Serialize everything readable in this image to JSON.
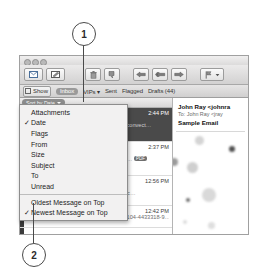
{
  "callouts": [
    {
      "id": "1",
      "label": "1"
    },
    {
      "id": "2",
      "label": "2"
    }
  ],
  "window": {
    "traffic_lights": [
      "close-button",
      "minimize-button",
      "zoom-button"
    ],
    "toolbar": {
      "get_mail_icon": "envelope-icon",
      "compose_icon": "compose-pencil-icon",
      "delete_icon": "trash-icon",
      "junk_icon": "junk-thumb-down-icon",
      "reply_icon": "reply-arrow-icon",
      "reply_all_icon": "reply-all-arrow-icon",
      "forward_icon": "forward-arrow-icon",
      "flag_icon": "flag-icon",
      "flag_caret_icon": "chevron-down-icon"
    },
    "mailbox_bar": {
      "show_label": "Show",
      "show_icon": "sidebar-icon",
      "items": [
        {
          "label": "Inbox",
          "selected": true
        },
        {
          "label": "VIPs ▾",
          "selected": false
        },
        {
          "label": "Sent",
          "selected": false
        },
        {
          "label": "Flagged",
          "selected": false
        },
        {
          "label": "Drafts (44)",
          "selected": false
        }
      ]
    },
    "message_list": {
      "sort_button": {
        "label": "Sort by Date",
        "caret_icon": "chevron-down-icon"
      },
      "messages": [
        {
          "sender": "",
          "time": "2:44 PM",
          "subject": "",
          "snippet": "Duis nonsequ simodio nost mam volore convect…",
          "badge": "",
          "selected": true
        },
        {
          "sender": "",
          "time": "2:37 PM",
          "subject": "",
          "snippet": "deserve said it would s for at least anoth…",
          "badge": "PDF",
          "selected": false
        },
        {
          "sender": "",
          "time": "12:56 PM",
          "subject": "Deals",
          "snippet": "Mani-Pedi at Simply — Columbus A basic…",
          "badge": "",
          "selected": false
        },
        {
          "sender": "Amazon.com Customer Service",
          "time": "12:42 PM",
          "subject": "",
          "snippet": "Your savings from Amazon.com (order #104-4433318-9…",
          "badge": "",
          "selected": false
        }
      ]
    },
    "reading_pane": {
      "from": "John Ray <johnra",
      "to": "To:  John Ray <jray",
      "subject": "Sample Email"
    }
  },
  "sort_menu": {
    "check_glyph": "✓",
    "groups": [
      {
        "items": [
          {
            "label": "Attachments",
            "checked": false
          },
          {
            "label": "Date",
            "checked": true
          },
          {
            "label": "Flags",
            "checked": false
          },
          {
            "label": "From",
            "checked": false
          },
          {
            "label": "Size",
            "checked": false
          },
          {
            "label": "Subject",
            "checked": false
          },
          {
            "label": "To",
            "checked": false
          },
          {
            "label": "Unread",
            "checked": false
          }
        ]
      },
      {
        "items": [
          {
            "label": "Oldest Message on Top",
            "checked": false
          },
          {
            "label": "Newest Message on Top",
            "checked": true
          }
        ]
      }
    ]
  }
}
